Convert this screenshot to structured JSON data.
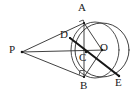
{
  "figure": {
    "canvas": {
      "width": 139,
      "height": 97
    },
    "background_color": "#ffffff",
    "line_color": "#2b2b2b",
    "bold_line_color": "#161616",
    "label_color": "#1a1a1a"
  },
  "points": [
    {
      "id": "P",
      "label": "P",
      "x": 22,
      "y": 52,
      "label_x": 9,
      "label_y": 44,
      "role": "external-point"
    },
    {
      "id": "A",
      "label": "A",
      "x": 84,
      "y": 23,
      "label_x": 78,
      "label_y": 2,
      "role": "tangent-point-upper"
    },
    {
      "id": "B",
      "label": "B",
      "x": 84,
      "y": 77,
      "label_x": 80,
      "label_y": 80,
      "role": "tangent-point-lower"
    },
    {
      "id": "D",
      "label": "D",
      "x": 70,
      "y": 38,
      "label_x": 60,
      "label_y": 29,
      "role": "point-on-PA"
    },
    {
      "id": "C",
      "label": "C",
      "x": 86,
      "y": 52,
      "label_x": 79,
      "label_y": 52,
      "role": "intersection-AB-PO"
    },
    {
      "id": "O",
      "label": "O",
      "x": 102,
      "y": 50,
      "label_x": 100,
      "label_y": 42,
      "role": "circle-center"
    },
    {
      "id": "E",
      "label": "E",
      "x": 119,
      "y": 76,
      "label_x": 115,
      "label_y": 77,
      "role": "point-on-circle"
    }
  ],
  "circle": {
    "name": "main-circle",
    "center_x": 102,
    "center_y": 50,
    "radius": 27
  },
  "arc": {
    "name": "secondary-arc",
    "center_x": 95,
    "center_y": 50,
    "radius_x": 24,
    "radius_y": 28,
    "description": "arc through A, D, C and B"
  },
  "segments": [
    {
      "id": "PA",
      "name": "segment-P-A",
      "from": "P",
      "to": "A",
      "weight": "thin"
    },
    {
      "id": "PB",
      "name": "segment-P-B",
      "from": "P",
      "to": "B",
      "weight": "thin"
    },
    {
      "id": "PO",
      "name": "segment-P-O",
      "from": "P",
      "to": "O",
      "weight": "thin"
    },
    {
      "id": "AB",
      "name": "chord-A-B",
      "from": "A",
      "to": "B",
      "weight": "thin"
    },
    {
      "id": "AO",
      "name": "radius-A-O",
      "from": "A",
      "to": "O",
      "weight": "thin"
    },
    {
      "id": "BO",
      "name": "radius-B-O",
      "from": "B",
      "to": "O",
      "weight": "thin"
    },
    {
      "id": "DE",
      "name": "segment-D-E",
      "from": "D",
      "to": "E",
      "weight": "bold"
    }
  ],
  "right_angle_marks": [
    {
      "id": "angle-at-A",
      "name": "right-angle-mark-A",
      "x": 80,
      "y": 19
    },
    {
      "id": "angle-at-B",
      "name": "right-angle-mark-B",
      "x": 80,
      "y": 71
    }
  ]
}
